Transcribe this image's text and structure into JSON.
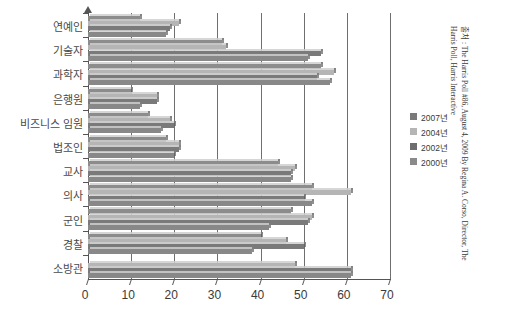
{
  "chart_data": {
    "type": "bar",
    "orientation": "horizontal",
    "title": "",
    "xlabel": "",
    "ylabel": "",
    "xlim": [
      0,
      70
    ],
    "xticks": [
      0,
      10,
      20,
      30,
      40,
      50,
      60,
      70
    ],
    "grid": true,
    "legend_position": "right",
    "categories": [
      "연예인",
      "기술자",
      "과학자",
      "은행원",
      "비즈니스 임원",
      "법조인",
      "교사",
      "의사",
      "군인",
      "경찰",
      "소방관"
    ],
    "series": [
      {
        "name": "2007년",
        "color": "#8c8c8c",
        "values": [
          12,
          31,
          54,
          10,
          14,
          18,
          44,
          52,
          47,
          40,
          0
        ]
      },
      {
        "name": "2004년",
        "color": "#b5b5b5",
        "values": [
          21,
          32,
          57,
          16,
          19,
          21,
          48,
          61,
          52,
          46,
          48
        ]
      },
      {
        "name": "2002년",
        "color": "#7a7a7a",
        "values": [
          19,
          54,
          53,
          16,
          20,
          21,
          47,
          50,
          51,
          50,
          61
        ]
      },
      {
        "name": "2000년",
        "color": "#888888",
        "values": [
          18,
          51,
          56,
          12,
          17,
          20,
          47,
          52,
          42,
          38,
          61
        ]
      }
    ]
  },
  "legend": {
    "items": [
      {
        "label": "2007년",
        "color": "#7a7a7a"
      },
      {
        "label": "2004년",
        "color": "#b5b5b5"
      },
      {
        "label": "2002년",
        "color": "#6d6d6d"
      },
      {
        "label": "2000년",
        "color": "#8a8a8a"
      }
    ]
  },
  "source": {
    "text": "출처 : The Harris Poll #86, August 4, 2009 By Regina A. Corso, Director, The Harris Poll, Harris Interactive"
  }
}
